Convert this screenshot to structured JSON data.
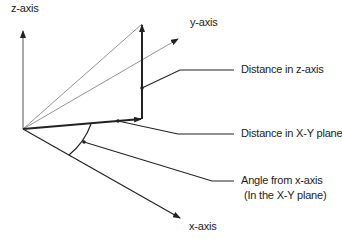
{
  "diagram": {
    "axes": {
      "z_axis": "z-axis",
      "y_axis": "y-axis",
      "x_axis": "x-axis"
    },
    "callouts": {
      "z_distance": "Distance in z-axis",
      "xy_distance": "Distance in X-Y plane",
      "angle_line1": "Angle from x-axis",
      "angle_line2": "(In the X-Y plane)"
    },
    "colors": {
      "line": "#222222",
      "thin_line": "#666666",
      "background": "#ffffff"
    }
  }
}
